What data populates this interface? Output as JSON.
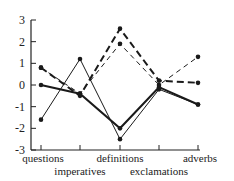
{
  "chart_data": {
    "type": "line",
    "title": "",
    "xlabel": "",
    "ylabel": "",
    "categories": [
      "questions",
      "imperatives",
      "definitions",
      "exclamations",
      "adverbs"
    ],
    "category_label_rows": [
      0,
      1,
      0,
      1,
      0
    ],
    "y_ticks": [
      3,
      2,
      1,
      0,
      -1,
      -2,
      -3
    ],
    "ylim": [
      -3,
      3
    ],
    "grid": false,
    "legend": "none",
    "series": [
      {
        "name": "thick-dashed",
        "style": "dashed",
        "weight": "thick",
        "values": [
          0.8,
          -0.5,
          2.6,
          0.2,
          0.1
        ]
      },
      {
        "name": "thin-dashed",
        "style": "dashed",
        "weight": "thin",
        "values": [
          0.8,
          -0.4,
          1.9,
          0.0,
          1.3
        ]
      },
      {
        "name": "thick-solid",
        "style": "solid",
        "weight": "thick",
        "values": [
          0.0,
          -0.4,
          -2.0,
          -0.1,
          -0.9
        ]
      },
      {
        "name": "thin-solid",
        "style": "solid",
        "weight": "thin",
        "values": [
          -1.6,
          1.2,
          -2.5,
          -0.2,
          -0.9
        ]
      }
    ]
  }
}
